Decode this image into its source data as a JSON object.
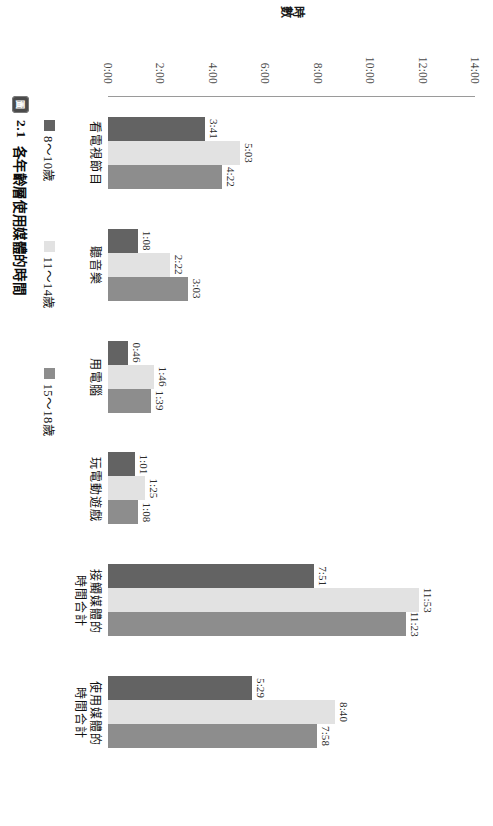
{
  "figure": {
    "caption_icon": "figure-icon",
    "caption_icon_glyph": "圖",
    "caption_number": "2.1",
    "caption_text": "各年齡層使用媒體的時間"
  },
  "axis": {
    "value_axis_title": "時數",
    "value_ticks": [
      "14:00",
      "12:00",
      "10:00",
      "8:00",
      "6:00",
      "4:00",
      "2:00",
      "0:00"
    ],
    "value_min": 0,
    "value_max": 14
  },
  "legend": {
    "items": [
      {
        "label": "8～10歲",
        "color": "#636363"
      },
      {
        "label": "11～14歲",
        "color": "#e2e2e2"
      },
      {
        "label": "15～18歲",
        "color": "#8d8d8d"
      }
    ]
  },
  "chart_data": {
    "type": "bar",
    "title": "各年齡層使用媒體的時間",
    "xlabel": "",
    "ylabel": "時數",
    "ylim": [
      0,
      14
    ],
    "grid": false,
    "legend_position": "bottom",
    "orientation": "vertical-bars-page-rotated-90cw",
    "categories": [
      "看電視節目",
      "聽音樂",
      "用電腦",
      "玩電動遊戲",
      "接觸媒體的\n時間合計",
      "使用媒體的\n時間合計"
    ],
    "categories_display": [
      [
        "看電視節目"
      ],
      [
        "聽音樂"
      ],
      [
        "用電腦"
      ],
      [
        "玩電動遊戲"
      ],
      [
        "接觸媒體的",
        "時間合計"
      ],
      [
        "使用媒體的",
        "時間合計"
      ]
    ],
    "series": [
      {
        "name": "8～10歲",
        "color": "#636363",
        "labels": [
          "3:41",
          "1:08",
          "0:46",
          "1:01",
          "7:51",
          "5:29"
        ],
        "values": [
          3.683,
          1.133,
          0.767,
          1.017,
          7.85,
          5.483
        ]
      },
      {
        "name": "11～14歲",
        "color": "#e2e2e2",
        "labels": [
          "5:03",
          "2:22",
          "1:46",
          "1:25",
          "11:53",
          "8:40"
        ],
        "values": [
          5.05,
          2.367,
          1.767,
          1.417,
          11.883,
          8.667
        ]
      },
      {
        "name": "15～18歲",
        "color": "#8d8d8d",
        "labels": [
          "4:22",
          "3:03",
          "1:39",
          "1:08",
          "11:23",
          "7:58"
        ],
        "values": [
          4.367,
          3.05,
          1.65,
          1.133,
          11.383,
          7.967
        ]
      }
    ]
  }
}
